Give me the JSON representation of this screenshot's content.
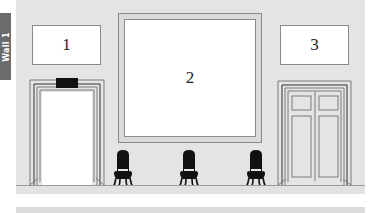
{
  "wall_label": "Wall 1",
  "colors": {
    "wall": "#e4e4e4",
    "frame_border": "#8a8a8a",
    "label_bg": "#6b6b6b",
    "chair": "#111111",
    "exit_sign": "#111111"
  },
  "artworks": [
    {
      "id": "1",
      "label": "1"
    },
    {
      "id": "2",
      "label": "2"
    },
    {
      "id": "3",
      "label": "3"
    }
  ],
  "doors": [
    {
      "name": "open-doorway",
      "type": "open",
      "has_sign": true
    },
    {
      "name": "double-door",
      "type": "double-panel"
    }
  ],
  "chairs": [
    {
      "name": "chair-1"
    },
    {
      "name": "chair-2"
    },
    {
      "name": "chair-3"
    }
  ]
}
